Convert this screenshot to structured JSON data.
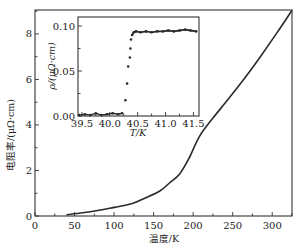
{
  "chart_data": [
    {
      "id": "main",
      "type": "line",
      "title": "",
      "xlabel": "温度/K",
      "ylabel": "电阻率/(μΩ·cm)",
      "xlim": [
        0,
        325
      ],
      "ylim": [
        0,
        9.05
      ],
      "xticks": [
        0,
        50,
        100,
        150,
        200,
        250,
        300
      ],
      "yticks": [
        0,
        2,
        4,
        6,
        8
      ],
      "grid": false,
      "legend": null,
      "series": [
        {
          "name": "resistivity",
          "x": [
            40,
            45,
            60,
            81,
            100,
            123,
            140,
            158,
            170,
            183,
            195,
            208,
            225,
            246,
            265,
            285,
            305,
            325
          ],
          "y": [
            0.05,
            0.08,
            0.14,
            0.25,
            0.38,
            0.55,
            0.8,
            1.1,
            1.45,
            1.85,
            2.55,
            3.5,
            4.3,
            5.2,
            6.05,
            7.0,
            8.0,
            9.04
          ]
        }
      ]
    },
    {
      "id": "inset",
      "type": "scatter",
      "title": "",
      "xlabel": "T/K",
      "ylabel": "ρ/(μΩ·cm)",
      "xlim": [
        39.43,
        41.6
      ],
      "ylim": [
        0,
        0.11
      ],
      "xticks": [
        39.5,
        40.0,
        40.5,
        41.0,
        41.5
      ],
      "yticks": [
        0.0,
        0.05,
        0.1
      ],
      "grid": false,
      "legend": null,
      "series": [
        {
          "name": "transition",
          "x": [
            39.45,
            39.55,
            39.65,
            39.75,
            39.85,
            39.95,
            40.05,
            40.15,
            40.22,
            40.28,
            40.31,
            40.33,
            40.36,
            40.37,
            40.38,
            40.4,
            40.43,
            40.47,
            40.55,
            40.65,
            40.75,
            40.85,
            40.95,
            41.05,
            41.15,
            41.25,
            41.35,
            41.45,
            41.55
          ],
          "y": [
            0.001,
            0.002,
            0.001,
            0.003,
            0.001,
            0.002,
            0.003,
            0.002,
            0.003,
            0.0175,
            0.036,
            0.055,
            0.065,
            0.075,
            0.085,
            0.09,
            0.093,
            0.094,
            0.093,
            0.094,
            0.093,
            0.094,
            0.094,
            0.095,
            0.094,
            0.095,
            0.096,
            0.095,
            0.094
          ]
        }
      ]
    }
  ],
  "labels": {
    "main_xlabel": "温度/K",
    "main_ylabel": "电阻率/(μΩ·cm)",
    "inset_xlabel": "T/K",
    "inset_ylabel": "ρ/(μΩ·cm)"
  },
  "colors": {
    "line": "#2a2a2a",
    "axis": "#333333",
    "marker": "#2a2a2a"
  }
}
